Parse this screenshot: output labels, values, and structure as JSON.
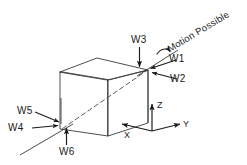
{
  "figure": {
    "type": "engineering-diagram",
    "background_color": "#ffffff",
    "line_color": "#1a1a1a",
    "text_color": "#1a1a1a"
  },
  "annotation": {
    "motion_possible": "Motion Possible",
    "rotation_arrow": "curved-rotation-arrow"
  },
  "wrenches": [
    {
      "id": "w1",
      "label": "W1"
    },
    {
      "id": "w2",
      "label": "W2"
    },
    {
      "id": "w3",
      "label": "W3"
    },
    {
      "id": "w4",
      "label": "W4"
    },
    {
      "id": "w5",
      "label": "W5"
    },
    {
      "id": "w6",
      "label": "W6"
    }
  ],
  "axes": [
    {
      "id": "x",
      "label": "X"
    },
    {
      "id": "y",
      "label": "Y"
    },
    {
      "id": "z",
      "label": "Z"
    }
  ]
}
